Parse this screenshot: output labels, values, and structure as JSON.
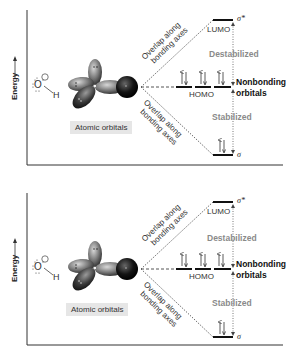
{
  "panels": [
    {
      "id": "top",
      "axis_label": "Energy",
      "molecule": {
        "atom": "O",
        "charge": "−",
        "partner": "H"
      },
      "atomic_orbitals_label": "Atomic orbitals",
      "overlap_upper": [
        "Overlap along",
        "bonding axes"
      ],
      "overlap_lower": [
        "Overlap along",
        "bonding axes"
      ],
      "lumo_label": "LUMO",
      "homo_label": "HOMO",
      "sigma_star": "σ*",
      "sigma": "σ",
      "destabilized": "Destabilized",
      "stabilized": "Stabilized",
      "nonbonding": [
        "Nonbonding",
        "orbitals"
      ]
    },
    {
      "id": "bottom",
      "axis_label": "Energy",
      "molecule": {
        "atom": "O",
        "charge": "−",
        "partner": "H"
      },
      "atomic_orbitals_label": "Atomic orbitals",
      "overlap_upper": [
        "Overlap along",
        "bonding axes"
      ],
      "overlap_lower": [
        "Overlap along",
        "bonding axes"
      ],
      "lumo_label": "LUMO",
      "homo_label": "HOMO",
      "sigma_star": "σ*",
      "sigma": "σ",
      "destabilized": "Destabilized",
      "stabilized": "Stabilized",
      "nonbonding": [
        "Nonbonding",
        "orbitals"
      ]
    }
  ],
  "energy_levels": {
    "sigma_star": {
      "electrons": 0
    },
    "nonbonding": {
      "count": 3,
      "electrons_each": 2
    },
    "sigma": {
      "electrons": 2
    }
  },
  "colors": {
    "axis": "#333333",
    "level": "#111111",
    "dotted": "#555555",
    "gray_text": "#8a8a8a",
    "label_box": "#e6e6e6"
  }
}
